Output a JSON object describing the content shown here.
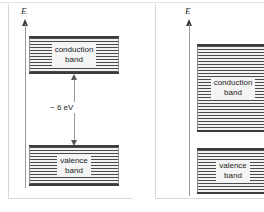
{
  "figure": {
    "type": "energy-band-diagram",
    "panels": [
      {
        "id": "insulator",
        "axis_label": "E",
        "bands": [
          {
            "name": "conduction",
            "line1": "conduction",
            "line2": "band"
          },
          {
            "name": "valence",
            "line1": "valence",
            "line2": "band"
          }
        ],
        "gap": {
          "label": "~ 6 eV"
        }
      },
      {
        "id": "semiconductor",
        "axis_label": "E",
        "bands": [
          {
            "name": "conduction",
            "line1": "conduction",
            "line2": "band"
          },
          {
            "name": "valence",
            "line1": "valence",
            "line2": "band"
          }
        ],
        "gap": {
          "label": ""
        }
      }
    ],
    "colors": {
      "band_stripe_dark": "#4a4a4a",
      "band_stripe_light": "#f2f2f2",
      "band_border": "#3c3c3c",
      "axis": "#9a9a9a",
      "frame": "#d8d8d8",
      "text": "#1c1c1c"
    }
  }
}
